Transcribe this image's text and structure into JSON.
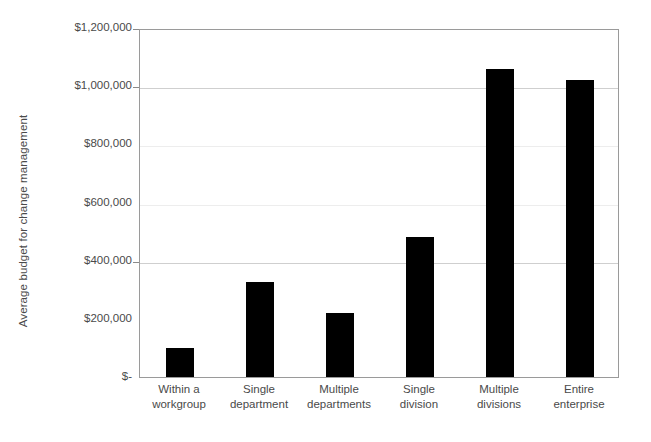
{
  "chart_data": {
    "type": "bar",
    "title": "",
    "xlabel": "",
    "ylabel": "Average budget for change management",
    "categories": [
      "Within a workgroup",
      "Single department",
      "Multiple departments",
      "Single division",
      "Multiple divisions",
      "Entire enterprise"
    ],
    "category_lines": [
      [
        "Within a",
        "workgroup"
      ],
      [
        "Single",
        "department"
      ],
      [
        "Multiple",
        "departments"
      ],
      [
        "Single",
        "division"
      ],
      [
        "Multiple",
        "divisions"
      ],
      [
        "Entire",
        "enterprise"
      ]
    ],
    "values": [
      100000,
      325000,
      220000,
      480000,
      1060000,
      1020000
    ],
    "value_labels": [
      "$100,000",
      "$325,000",
      "$220,000",
      "$480,000",
      "$1,060,000",
      "$1,020,000"
    ],
    "ylim": [
      0,
      1200000
    ],
    "ytick_values": [
      0,
      200000,
      400000,
      600000,
      800000,
      1000000,
      1200000
    ],
    "ytick_labels": [
      "$-",
      "$200,000",
      "$400,000",
      "$600,000",
      "$800,000",
      "$1,000,000",
      "$1,200,000"
    ],
    "grid": true,
    "gridline_values": [
      400000,
      600000,
      800000,
      1000000
    ],
    "legend": null,
    "legend_position": "none",
    "bar_color": "#000000",
    "axis_color": "#9a9a9a",
    "grid_color": "#cfcfcf",
    "text_color": "#4a4a4a"
  }
}
